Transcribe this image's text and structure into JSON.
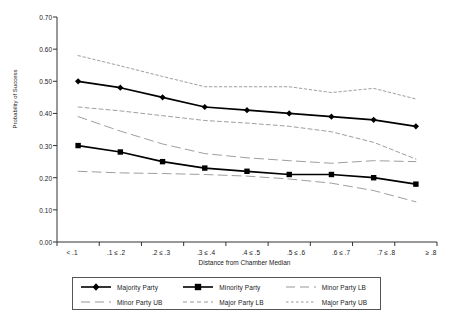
{
  "chart_data": {
    "type": "line",
    "title": "",
    "xlabel": "Distance from Chamber Median",
    "ylabel": "Probability of Success",
    "categories": [
      "< .1",
      ".1 ≤ .2",
      ".2 ≤ .3",
      ".3 ≤ .4",
      ".4 ≤ .5",
      ".5 ≤ .6",
      ".6 ≤ .7",
      ".7 ≤ .8",
      "≥ .8"
    ],
    "ylim": [
      0.0,
      0.7
    ],
    "yticks": [
      "0.00",
      "0.10",
      "0.20",
      "0.30",
      "0.40",
      "0.50",
      "0.60",
      "0.70"
    ],
    "ytick_values": [
      0.0,
      0.1,
      0.2,
      0.3,
      0.4,
      0.5,
      0.6,
      0.7
    ],
    "grid": false,
    "legend_position": "bottom",
    "series": [
      {
        "name": "Majority Party",
        "marker": "diamond",
        "style": "solid",
        "color": "#000000",
        "values": [
          0.5,
          0.48,
          0.45,
          0.42,
          0.41,
          0.4,
          0.39,
          0.38,
          0.36
        ]
      },
      {
        "name": "Minority Party",
        "marker": "square",
        "style": "solid",
        "color": "#000000",
        "values": [
          0.3,
          0.28,
          0.25,
          0.23,
          0.22,
          0.21,
          0.21,
          0.2,
          0.18
        ]
      },
      {
        "name": "Minor Party LB",
        "marker": "none",
        "style": "long-dash",
        "color": "#8c8c8c",
        "values": [
          0.22,
          0.215,
          0.213,
          0.21,
          0.205,
          0.196,
          0.183,
          0.16,
          0.125
        ]
      },
      {
        "name": "Minor Party UB",
        "marker": "none",
        "style": "long-dash",
        "color": "#8c8c8c",
        "values": [
          0.39,
          0.345,
          0.305,
          0.275,
          0.262,
          0.253,
          0.245,
          0.253,
          0.25
        ]
      },
      {
        "name": "Major Party LB",
        "marker": "none",
        "style": "short-dash",
        "color": "#8c8c8c",
        "values": [
          0.42,
          0.408,
          0.393,
          0.378,
          0.37,
          0.36,
          0.343,
          0.31,
          0.258
        ]
      },
      {
        "name": "Major Party UB",
        "marker": "none",
        "style": "dotted",
        "color": "#8c8c8c",
        "values": [
          0.58,
          0.548,
          0.515,
          0.483,
          0.483,
          0.483,
          0.465,
          0.478,
          0.445
        ]
      }
    ]
  },
  "legend": {
    "entries": [
      {
        "label": "Majority Party",
        "key": "majority-party"
      },
      {
        "label": "Minority Party",
        "key": "minority-party"
      },
      {
        "label": "Minor Party LB",
        "key": "minor-party-lb"
      },
      {
        "label": "Minor Party UB",
        "key": "minor-party-ub"
      },
      {
        "label": "Major Party LB",
        "key": "major-party-lb"
      },
      {
        "label": "Major Party UB",
        "key": "major-party-ub"
      }
    ]
  }
}
